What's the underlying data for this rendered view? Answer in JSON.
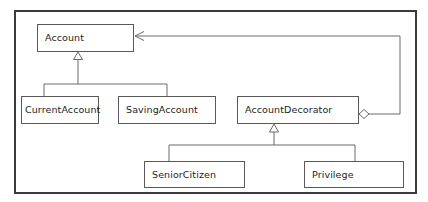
{
  "diagram": {
    "kind": "uml-class-diagram",
    "canvas": {
      "width": 428,
      "height": 202,
      "background": "#ffffff"
    },
    "frame": {
      "x": 14,
      "y": 10,
      "width": 403,
      "height": 184,
      "stroke": "#3a3a3a",
      "stroke_width": 2
    },
    "style": {
      "box_stroke": "#5a5a5a",
      "box_fill": "#ffffff",
      "line_stroke": "#6a6a6a",
      "text_color": "#1d1d1d",
      "font_size": 9.5
    },
    "classes": [
      {
        "id": "account",
        "label": "Account",
        "x": 37,
        "y": 24,
        "width": 97,
        "height": 28
      },
      {
        "id": "current-account",
        "label": "CurrentAccount",
        "x": 21,
        "y": 96,
        "width": 78,
        "height": 28
      },
      {
        "id": "saving-account",
        "label": "SavingAccount",
        "x": 118,
        "y": 96,
        "width": 98,
        "height": 28
      },
      {
        "id": "account-decorator",
        "label": "AccountDecorator",
        "x": 237,
        "y": 96,
        "width": 122,
        "height": 28
      },
      {
        "id": "senior-citizen",
        "label": "SeniorCitizen",
        "x": 144,
        "y": 161,
        "width": 101,
        "height": 27
      },
      {
        "id": "privilege",
        "label": "Privilege",
        "x": 304,
        "y": 161,
        "width": 100,
        "height": 27
      }
    ],
    "relationships": [
      {
        "id": "current-account-inherits-account",
        "type": "generalization",
        "source": "CurrentAccount",
        "target": "Account",
        "marker": "hollow-triangle"
      },
      {
        "id": "saving-account-inherits-account",
        "type": "generalization",
        "source": "SavingAccount",
        "target": "Account",
        "marker": "hollow-triangle"
      },
      {
        "id": "senior-citizen-inherits-account-decorator",
        "type": "generalization",
        "source": "SeniorCitizen",
        "target": "AccountDecorator",
        "marker": "hollow-triangle"
      },
      {
        "id": "privilege-inherits-account-decorator",
        "type": "generalization",
        "source": "Privilege",
        "target": "AccountDecorator",
        "marker": "hollow-triangle"
      },
      {
        "id": "account-decorator-aggregates-account",
        "type": "aggregation",
        "source": "AccountDecorator",
        "target": "Account",
        "marker": "hollow-diamond",
        "arrow": "open-arrow"
      }
    ]
  }
}
